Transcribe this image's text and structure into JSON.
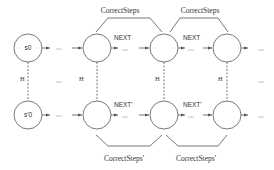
{
  "diagram": {
    "colors": {
      "stroke": "#555555",
      "text": "#333333",
      "background": "#ffffff"
    },
    "top_row": {
      "states": [
        {
          "id": "s0",
          "label": "s0"
        },
        {
          "id": "t1",
          "label": ""
        },
        {
          "id": "t2",
          "label": ""
        },
        {
          "id": "t3",
          "label": ""
        }
      ],
      "next_labels": [
        "NEXT",
        "NEXT"
      ],
      "ellipsis": "..."
    },
    "bottom_row": {
      "states": [
        {
          "id": "s'0",
          "label": "s'0"
        },
        {
          "id": "b1",
          "label": ""
        },
        {
          "id": "b2",
          "label": ""
        },
        {
          "id": "b3",
          "label": ""
        }
      ],
      "next_labels": [
        "NEXT'",
        "NEXT'"
      ],
      "ellipsis": "..."
    },
    "relation_label": "H",
    "braces_top": [
      "CorrectSteps",
      "CorrectSteps"
    ],
    "braces_bottom": [
      "CorrectSteps'",
      "CorrectSteps'"
    ]
  }
}
